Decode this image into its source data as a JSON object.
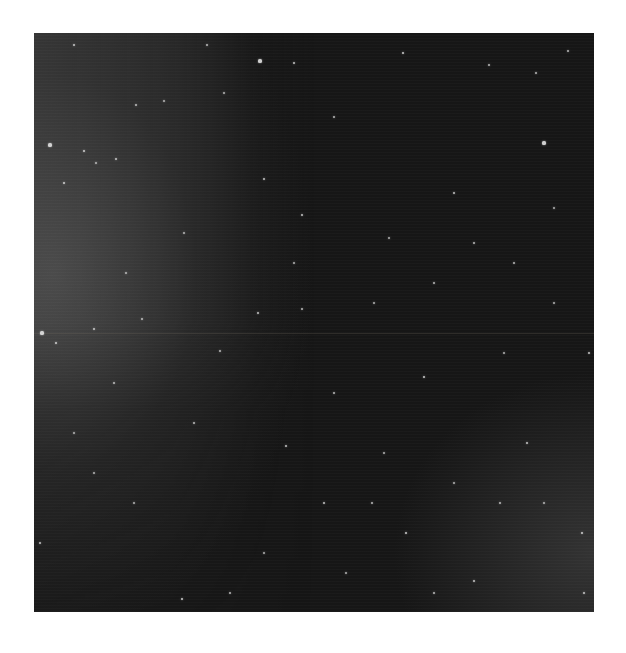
{
  "image": {
    "subject": "Star field",
    "background_color": "#161616",
    "left_glow_color": "#5a5a5a",
    "seam_y": 300
  },
  "stars": [
    {
      "x": 40,
      "y": 12,
      "r": 1.6
    },
    {
      "x": 173,
      "y": 12,
      "r": 1.4
    },
    {
      "x": 226,
      "y": 28,
      "r": 2.0
    },
    {
      "x": 260,
      "y": 30,
      "r": 1.6
    },
    {
      "x": 369,
      "y": 20,
      "r": 1.8
    },
    {
      "x": 455,
      "y": 32,
      "r": 1.4
    },
    {
      "x": 502,
      "y": 40,
      "r": 1.4
    },
    {
      "x": 16,
      "y": 112,
      "r": 2.0
    },
    {
      "x": 50,
      "y": 118,
      "r": 1.8
    },
    {
      "x": 82,
      "y": 126,
      "r": 1.6
    },
    {
      "x": 230,
      "y": 146,
      "r": 1.6
    },
    {
      "x": 510,
      "y": 110,
      "r": 2.0
    },
    {
      "x": 534,
      "y": 18,
      "r": 1.4
    },
    {
      "x": 30,
      "y": 150,
      "r": 1.8
    },
    {
      "x": 62,
      "y": 130,
      "r": 1.2
    },
    {
      "x": 102,
      "y": 72,
      "r": 1.4
    },
    {
      "x": 130,
      "y": 68,
      "r": 1.2
    },
    {
      "x": 190,
      "y": 60,
      "r": 1.2
    },
    {
      "x": 300,
      "y": 84,
      "r": 1.4
    },
    {
      "x": 420,
      "y": 160,
      "r": 1.6
    },
    {
      "x": 268,
      "y": 182,
      "r": 1.6
    },
    {
      "x": 440,
      "y": 210,
      "r": 1.4
    },
    {
      "x": 480,
      "y": 230,
      "r": 1.4
    },
    {
      "x": 355,
      "y": 205,
      "r": 1.2
    },
    {
      "x": 400,
      "y": 250,
      "r": 1.4
    },
    {
      "x": 520,
      "y": 175,
      "r": 1.2
    },
    {
      "x": 8,
      "y": 300,
      "r": 2.0
    },
    {
      "x": 22,
      "y": 310,
      "r": 1.8
    },
    {
      "x": 60,
      "y": 296,
      "r": 1.6
    },
    {
      "x": 108,
      "y": 286,
      "r": 1.4
    },
    {
      "x": 186,
      "y": 318,
      "r": 1.4
    },
    {
      "x": 224,
      "y": 280,
      "r": 1.6
    },
    {
      "x": 268,
      "y": 276,
      "r": 1.4
    },
    {
      "x": 390,
      "y": 344,
      "r": 1.8
    },
    {
      "x": 300,
      "y": 360,
      "r": 1.4
    },
    {
      "x": 252,
      "y": 413,
      "r": 1.6
    },
    {
      "x": 160,
      "y": 390,
      "r": 1.4
    },
    {
      "x": 80,
      "y": 350,
      "r": 1.4
    },
    {
      "x": 6,
      "y": 510,
      "r": 1.6
    },
    {
      "x": 148,
      "y": 566,
      "r": 1.8
    },
    {
      "x": 196,
      "y": 560,
      "r": 1.4
    },
    {
      "x": 290,
      "y": 470,
      "r": 1.6
    },
    {
      "x": 338,
      "y": 470,
      "r": 1.4
    },
    {
      "x": 372,
      "y": 500,
      "r": 1.8
    },
    {
      "x": 400,
      "y": 560,
      "r": 1.4
    },
    {
      "x": 440,
      "y": 548,
      "r": 1.6
    },
    {
      "x": 493,
      "y": 410,
      "r": 1.6
    },
    {
      "x": 548,
      "y": 500,
      "r": 1.8
    },
    {
      "x": 550,
      "y": 560,
      "r": 1.6
    },
    {
      "x": 520,
      "y": 270,
      "r": 1.2
    },
    {
      "x": 470,
      "y": 320,
      "r": 1.2
    },
    {
      "x": 555,
      "y": 320,
      "r": 1.6
    },
    {
      "x": 350,
      "y": 420,
      "r": 1.2
    },
    {
      "x": 230,
      "y": 520,
      "r": 1.2
    },
    {
      "x": 100,
      "y": 470,
      "r": 1.2
    },
    {
      "x": 60,
      "y": 440,
      "r": 1.2
    },
    {
      "x": 420,
      "y": 450,
      "r": 1.2
    },
    {
      "x": 466,
      "y": 470,
      "r": 1.4
    },
    {
      "x": 340,
      "y": 270,
      "r": 1.2
    },
    {
      "x": 150,
      "y": 200,
      "r": 1.2
    },
    {
      "x": 92,
      "y": 240,
      "r": 1.2
    },
    {
      "x": 260,
      "y": 230,
      "r": 1.2
    },
    {
      "x": 40,
      "y": 400,
      "r": 1.2
    },
    {
      "x": 312,
      "y": 540,
      "r": 1.2
    },
    {
      "x": 510,
      "y": 470,
      "r": 1.2
    }
  ]
}
